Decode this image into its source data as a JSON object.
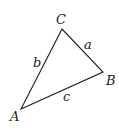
{
  "diagram": {
    "type": "triangle",
    "stroke_color": "#1a1a1a",
    "vertices": {
      "A": {
        "label": "A",
        "x": 21,
        "y": 109
      },
      "B": {
        "label": "B",
        "x": 103,
        "y": 72
      },
      "C": {
        "label": "C",
        "x": 62,
        "y": 29
      }
    },
    "sides": {
      "a": {
        "label": "a",
        "between": [
          "B",
          "C"
        ]
      },
      "b": {
        "label": "b",
        "between": [
          "A",
          "C"
        ]
      },
      "c": {
        "label": "c",
        "between": [
          "A",
          "B"
        ]
      }
    }
  }
}
